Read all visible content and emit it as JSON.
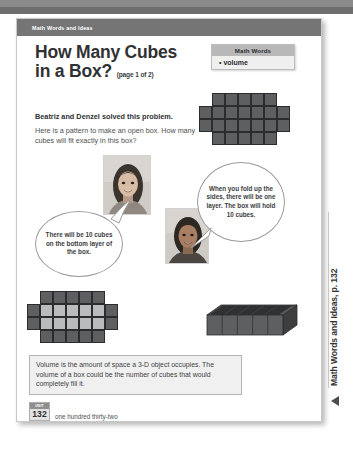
{
  "running_head": "Math Words and Ideas",
  "title": {
    "line1": "How Many Cubes",
    "line2": "in a Box?",
    "page_of": "(page 1 of 2)"
  },
  "intro": {
    "bold": "Beatriz and Denzel solved this problem.",
    "body": "Here is a pattern to make an open box. How many cubes will fit exactly in this box?"
  },
  "math_words": {
    "heading": "Math Words",
    "items": [
      "volume"
    ],
    "bullet": "•"
  },
  "bubbles": {
    "left": "There will be 10 cubes on the bottom layer of the box.",
    "right": "When you fold up the sides, there will be one layer. The box will hold 10 cubes."
  },
  "definition": "Volume is the amount of space a 3-D object occupies. The volume of a box could be the number of cubes that would completely fill it.",
  "footer": {
    "cap": "UNIT",
    "page_number": "132",
    "page_words": "one hundred thirty-two"
  },
  "margin_tab": {
    "label": "Math Words and Ideas, p. 132",
    "arrow": "left-triangle-icon"
  },
  "diagrams": {
    "net_top": {
      "name": "cube-net-pattern",
      "center_cols": 5,
      "center_rows": 4,
      "side_flap_rows": 2,
      "cell": 13
    },
    "net_bottom": {
      "name": "cube-net-pattern-highlighted",
      "center_cols": 5,
      "center_rows": 4,
      "side_flap_rows": 2,
      "highlight_rows": 2,
      "highlight_cols": 5,
      "highlight_count": 10,
      "cell": 13
    },
    "box_3d": {
      "name": "open-box-3d",
      "cubes_long": 5,
      "cubes_wide": 2,
      "layers": 1,
      "total_cubes": 10
    }
  },
  "photos": {
    "student_1": "student-photo-beatriz",
    "student_2": "student-photo-denzel"
  },
  "colors": {
    "header_band": "#757575",
    "cube_dark": "#5d5f61",
    "cube_light": "#b9bbbd",
    "box_fill": "#efefef"
  }
}
